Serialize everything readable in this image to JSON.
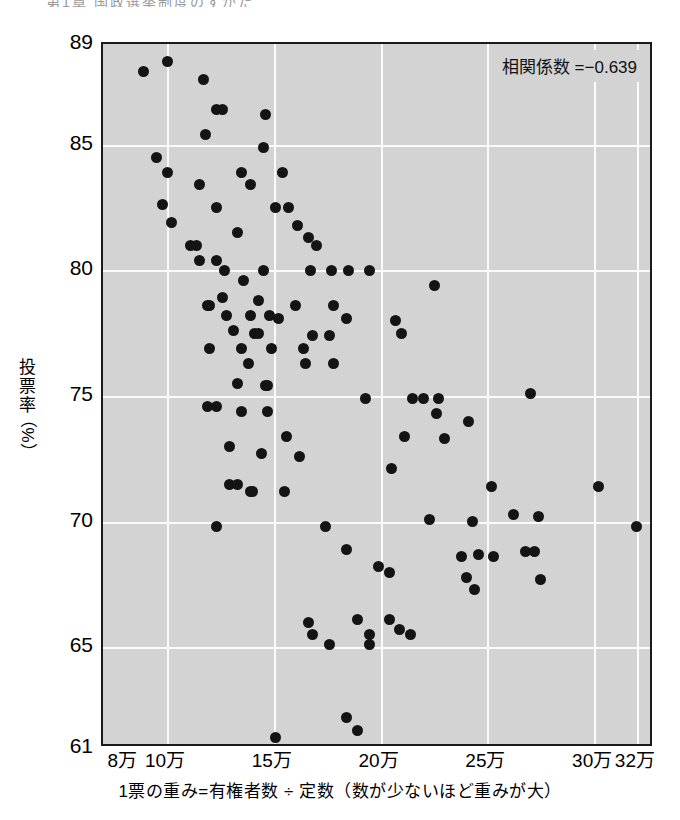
{
  "figure": {
    "heading_partial": "第1章  国政選挙制度のすがた",
    "annotation": "相関係数 =−0.639"
  },
  "chart_data": {
    "type": "scatter",
    "title": "",
    "xlabel": "1票の重み=有権者数 ÷ 定数（数が少ないほど重みが大）",
    "ylabel": "投票率（%）",
    "ylabel_chars": [
      "投",
      "票",
      "率"
    ],
    "ylabel_unit": "（%）",
    "ylabel_unit_char": "%",
    "xlim": [
      7.0,
      32.8
    ],
    "ylim": [
      61,
      89
    ],
    "x_unit": "万",
    "y_unit": "%",
    "grid": true,
    "legend": "none",
    "xticks": [
      8,
      10,
      15,
      20,
      25,
      30,
      32
    ],
    "xticklabels": [
      "8万",
      "10万",
      "15万",
      "20万",
      "25万",
      "30万",
      "32万"
    ],
    "x_gridlines": [
      10,
      15,
      20,
      25,
      30,
      32
    ],
    "yticks": [
      89,
      85,
      80,
      75,
      70,
      65,
      61
    ],
    "yticklabels": [
      "89",
      "85",
      "80",
      "75",
      "70",
      "65",
      "61"
    ],
    "y_gridlines": [
      85,
      80,
      75,
      70,
      65
    ],
    "correlation": -0.639,
    "marker": "filled-circle",
    "marker_color": "#141414",
    "plot_background": "#d3d3d3",
    "gridline_color": "#fbfbfb",
    "points": [
      [
        8.9,
        87.9
      ],
      [
        10.0,
        88.3
      ],
      [
        11.7,
        87.6
      ],
      [
        12.3,
        86.4
      ],
      [
        12.6,
        86.4
      ],
      [
        14.6,
        86.2
      ],
      [
        11.8,
        85.4
      ],
      [
        14.5,
        84.9
      ],
      [
        9.5,
        84.5
      ],
      [
        10.0,
        83.9
      ],
      [
        13.5,
        83.9
      ],
      [
        15.4,
        83.9
      ],
      [
        11.5,
        83.4
      ],
      [
        13.9,
        83.4
      ],
      [
        9.8,
        82.6
      ],
      [
        12.3,
        82.5
      ],
      [
        15.1,
        82.5
      ],
      [
        15.7,
        82.5
      ],
      [
        10.2,
        81.9
      ],
      [
        13.3,
        81.5
      ],
      [
        11.1,
        81.0
      ],
      [
        11.4,
        81.0
      ],
      [
        11.5,
        80.4
      ],
      [
        12.3,
        80.4
      ],
      [
        12.7,
        80.0
      ],
      [
        14.5,
        80.0
      ],
      [
        16.7,
        80.0
      ],
      [
        17.7,
        80.0
      ],
      [
        18.5,
        80.0
      ],
      [
        19.5,
        80.0
      ],
      [
        13.6,
        79.6
      ],
      [
        22.5,
        79.4
      ],
      [
        16.1,
        81.8
      ],
      [
        16.6,
        81.3
      ],
      [
        17.0,
        81.0
      ],
      [
        12.6,
        78.9
      ],
      [
        14.3,
        78.8
      ],
      [
        11.9,
        78.6
      ],
      [
        12.0,
        78.6
      ],
      [
        16.0,
        78.6
      ],
      [
        17.8,
        78.6
      ],
      [
        12.8,
        78.2
      ],
      [
        13.9,
        78.2
      ],
      [
        14.8,
        78.2
      ],
      [
        15.2,
        78.1
      ],
      [
        18.4,
        78.1
      ],
      [
        20.7,
        78.0
      ],
      [
        13.1,
        77.6
      ],
      [
        14.1,
        77.5
      ],
      [
        14.3,
        77.5
      ],
      [
        16.8,
        77.4
      ],
      [
        17.6,
        77.4
      ],
      [
        21.0,
        77.5
      ],
      [
        12.0,
        76.9
      ],
      [
        13.5,
        76.9
      ],
      [
        14.9,
        76.9
      ],
      [
        16.4,
        76.9
      ],
      [
        13.8,
        76.3
      ],
      [
        16.5,
        76.3
      ],
      [
        17.8,
        76.3
      ],
      [
        13.3,
        75.5
      ],
      [
        14.6,
        75.4
      ],
      [
        14.7,
        75.4
      ],
      [
        19.3,
        74.9
      ],
      [
        21.5,
        74.9
      ],
      [
        22.0,
        74.9
      ],
      [
        22.7,
        74.9
      ],
      [
        27.0,
        75.1
      ],
      [
        11.9,
        74.6
      ],
      [
        12.3,
        74.6
      ],
      [
        13.5,
        74.4
      ],
      [
        14.7,
        74.4
      ],
      [
        22.6,
        74.3
      ],
      [
        24.1,
        74.0
      ],
      [
        12.9,
        73.0
      ],
      [
        15.6,
        73.4
      ],
      [
        21.1,
        73.4
      ],
      [
        14.4,
        72.7
      ],
      [
        23.0,
        73.3
      ],
      [
        16.2,
        72.6
      ],
      [
        20.5,
        72.1
      ],
      [
        12.9,
        71.5
      ],
      [
        13.3,
        71.5
      ],
      [
        13.9,
        71.2
      ],
      [
        14.0,
        71.2
      ],
      [
        15.5,
        71.2
      ],
      [
        25.2,
        71.4
      ],
      [
        30.2,
        71.4
      ],
      [
        12.3,
        69.8
      ],
      [
        17.4,
        69.8
      ],
      [
        22.3,
        70.1
      ],
      [
        24.3,
        70.0
      ],
      [
        26.2,
        70.3
      ],
      [
        27.4,
        70.2
      ],
      [
        32.0,
        69.8
      ],
      [
        18.4,
        68.9
      ],
      [
        23.8,
        68.6
      ],
      [
        24.6,
        68.7
      ],
      [
        25.3,
        68.6
      ],
      [
        26.8,
        68.8
      ],
      [
        27.2,
        68.8
      ],
      [
        19.9,
        68.2
      ],
      [
        20.4,
        68.0
      ],
      [
        24.0,
        67.8
      ],
      [
        24.4,
        67.3
      ],
      [
        27.5,
        67.7
      ],
      [
        16.6,
        66.0
      ],
      [
        16.8,
        65.5
      ],
      [
        18.9,
        66.1
      ],
      [
        20.4,
        66.1
      ],
      [
        20.9,
        65.7
      ],
      [
        19.5,
        65.5
      ],
      [
        21.4,
        65.5
      ],
      [
        17.6,
        65.1
      ],
      [
        19.5,
        65.1
      ],
      [
        18.4,
        62.2
      ],
      [
        18.9,
        61.7
      ],
      [
        15.1,
        61.4
      ]
    ]
  }
}
